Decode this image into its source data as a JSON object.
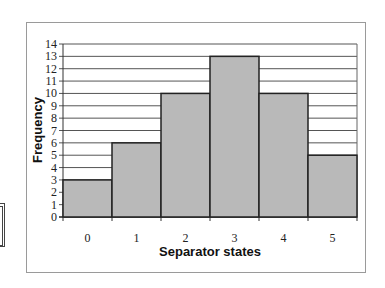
{
  "chart_data": {
    "type": "bar",
    "title": "",
    "xlabel": "Separator states",
    "ylabel": "Frequency",
    "categories": [
      "0",
      "1",
      "2",
      "3",
      "4",
      "5"
    ],
    "values": [
      3,
      6,
      10,
      13,
      10,
      5
    ],
    "ylim": [
      0,
      14
    ],
    "yticks": [
      "0",
      "1",
      "2",
      "3",
      "4",
      "5",
      "6",
      "7",
      "8",
      "9",
      "10",
      "11",
      "12",
      "13",
      "14"
    ],
    "grid": true,
    "legend": null,
    "bar_color": "#b9b9b9",
    "bar_edge_color": "#222222"
  }
}
